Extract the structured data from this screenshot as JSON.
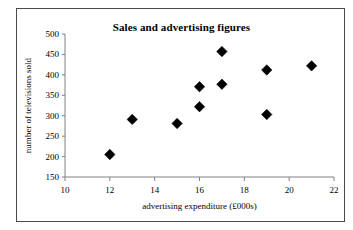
{
  "chart_data": {
    "type": "scatter",
    "title": "Sales and advertising figures",
    "xlabel": "advertising expenditure (£000s)",
    "ylabel": "number of televisions sold",
    "xlim": [
      10,
      22
    ],
    "ylim": [
      150,
      500
    ],
    "xticks": [
      10,
      12,
      14,
      16,
      18,
      20,
      22
    ],
    "yticks": [
      150,
      200,
      250,
      300,
      350,
      400,
      450,
      500
    ],
    "xtick_labels": [
      "10",
      "12",
      "14",
      "16",
      "18",
      "20",
      "22"
    ],
    "ytick_labels": [
      "150",
      "200",
      "250",
      "300",
      "350",
      "400",
      "450",
      "500"
    ],
    "grid": false,
    "legend": false,
    "marker": "diamond",
    "marker_color": "#000000",
    "series": [
      {
        "name": "televisions sold",
        "points": [
          {
            "x": 12,
            "y": 205
          },
          {
            "x": 13,
            "y": 291
          },
          {
            "x": 15,
            "y": 281
          },
          {
            "x": 16,
            "y": 322
          },
          {
            "x": 16,
            "y": 371
          },
          {
            "x": 17,
            "y": 377
          },
          {
            "x": 17,
            "y": 457
          },
          {
            "x": 19,
            "y": 303
          },
          {
            "x": 19,
            "y": 412
          },
          {
            "x": 21,
            "y": 422
          }
        ]
      }
    ]
  },
  "figure": {
    "border_color": "#4a4a4a",
    "axis_color": "#808080",
    "background": "#ffffff"
  }
}
